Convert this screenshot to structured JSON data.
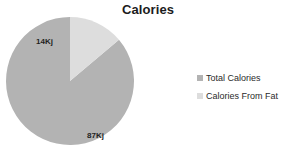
{
  "chart_data": {
    "type": "pie",
    "title": "Calories",
    "xlabel": "",
    "ylabel": "",
    "categories": [
      "Total Calories",
      "Calories From Fat"
    ],
    "values": [
      87,
      14
    ],
    "unit": "Kj",
    "data_labels": [
      "87Kj",
      "14Kj"
    ],
    "percentages": [
      86.1,
      13.9
    ],
    "grid": false,
    "legend_position": "right",
    "start_angle_deg": 0,
    "direction": "counterclockwise",
    "slice_colors": [
      "#b3b3b3",
      "#dddddd"
    ],
    "background_color": "#ffffff",
    "title_color": "#1c1c1c",
    "label_color": "#1f1f1f",
    "slices": [
      {
        "name": "Total Calories",
        "value": 87,
        "label": "87Kj",
        "color": "#b3b3b3",
        "percent": 86.1
      },
      {
        "name": "Calories From Fat",
        "value": 14,
        "label": "14Kj",
        "color": "#dddddd",
        "percent": 13.9
      }
    ]
  },
  "legend": {
    "items": [
      {
        "label": "Total Calories",
        "color": "#b3b3b3",
        "marker": "square-marker"
      },
      {
        "label": "Calories From Fat",
        "color": "#dddddd",
        "marker": "square-marker"
      }
    ]
  }
}
